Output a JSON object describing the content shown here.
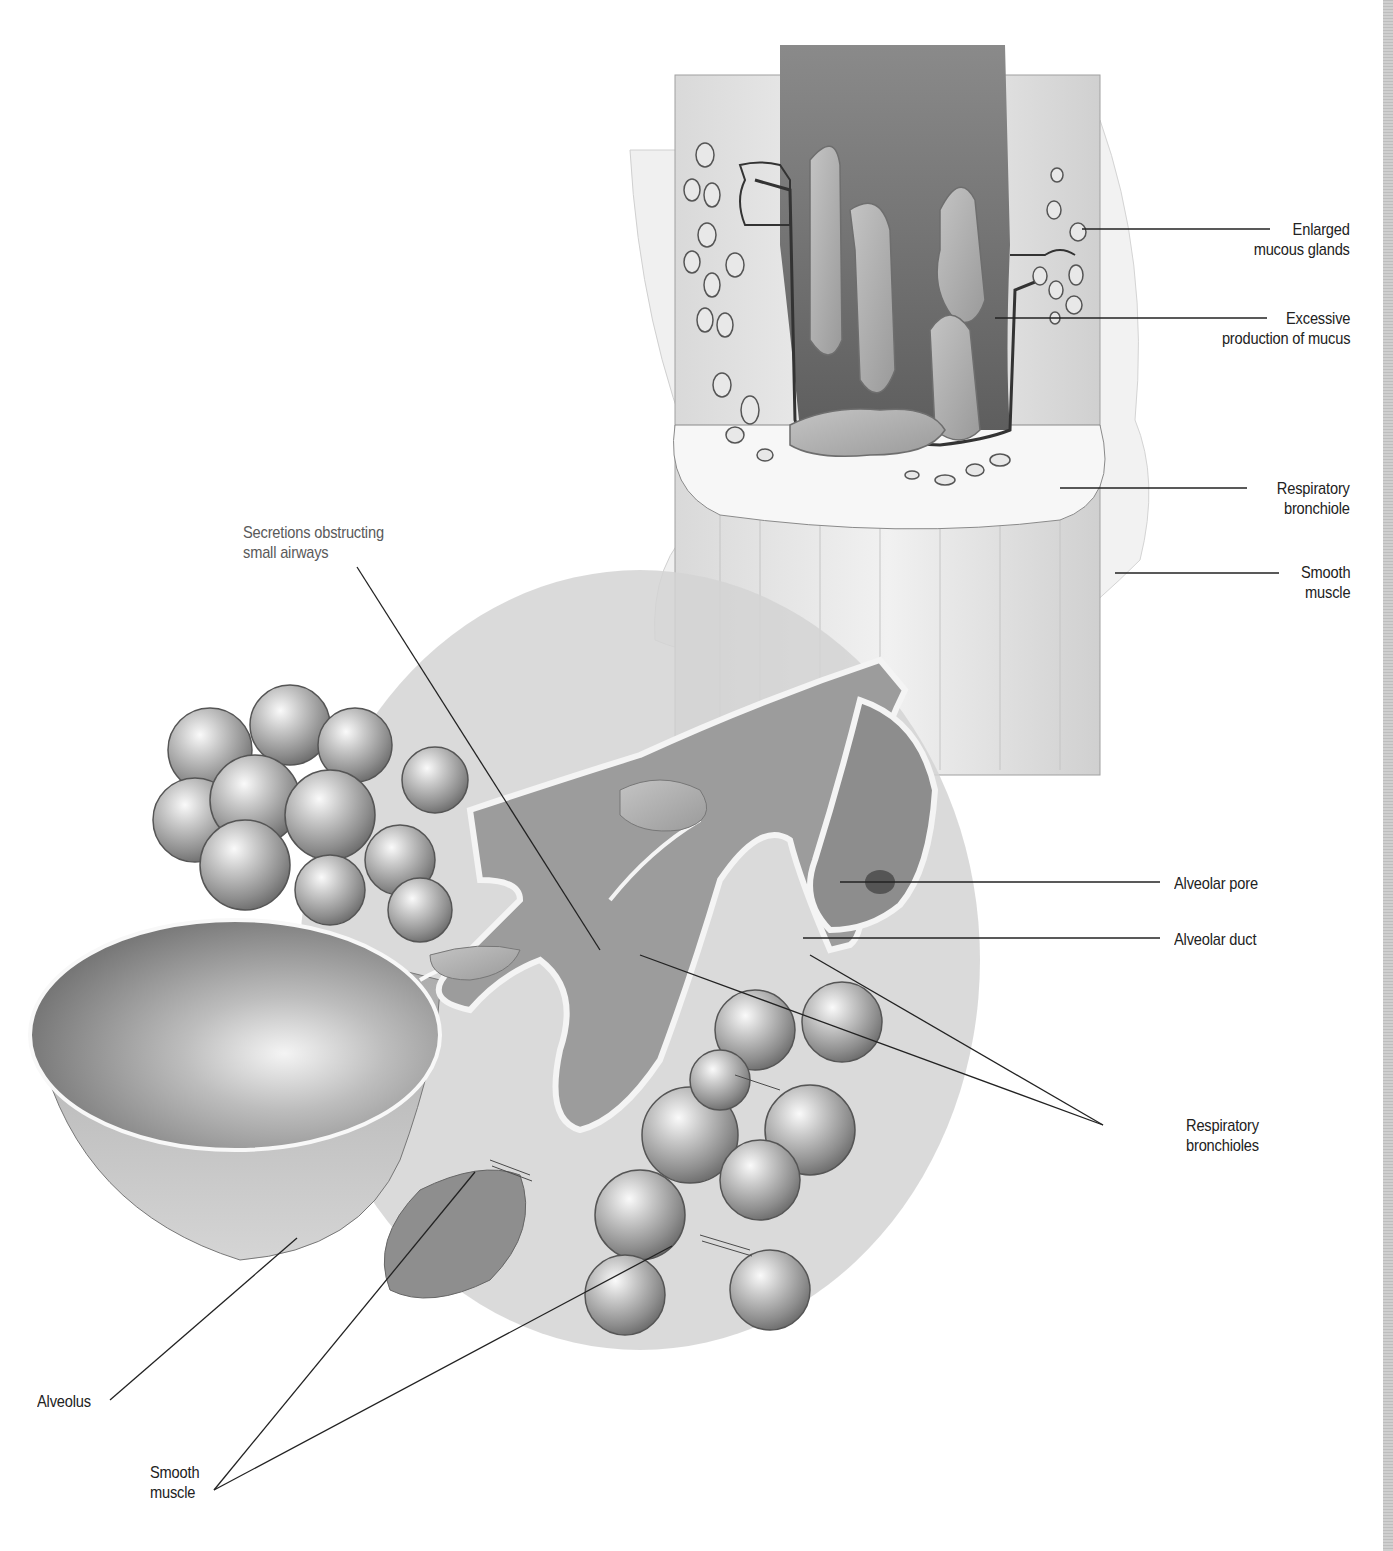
{
  "diagram": {
    "colors": {
      "background": "#ffffff",
      "ink": "#222222",
      "label_gray": "#5a5a5a",
      "tissue_light": "#e6e6e6",
      "tissue_mid": "#b5b5b5",
      "tissue_dark": "#6e6e6e",
      "inset_circle": "#cfcfcf"
    },
    "labels": {
      "enlarged_mucous_glands": {
        "line1": "Enlarged",
        "line2": "mucous glands"
      },
      "excessive_mucus": {
        "line1": "Excessive",
        "line2": "production of mucus"
      },
      "respiratory_bronchiole": {
        "line1": "Respiratory",
        "line2": "bronchiole"
      },
      "smooth_muscle_top": {
        "line1": "Smooth",
        "line2": "muscle"
      },
      "secretions": {
        "line1": "Secretions obstructing",
        "line2": "small airways"
      },
      "alveolar_pore": {
        "line1": "Alveolar pore"
      },
      "alveolar_duct": {
        "line1": "Alveolar duct"
      },
      "respiratory_bronchioles": {
        "line1": "Respiratory",
        "line2": "bronchioles"
      },
      "alveolus": {
        "line1": "Alveolus"
      },
      "smooth_muscle_bottom": {
        "line1": "Smooth",
        "line2": "muscle"
      }
    }
  }
}
